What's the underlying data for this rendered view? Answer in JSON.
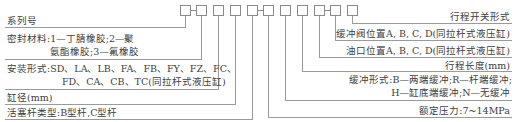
{
  "code_boxes": {
    "count": 11,
    "separators_after": [
      1,
      5,
      9
    ]
  },
  "left_labels": {
    "series": "系列号",
    "seal_line1": "密封材料:1—丁腈橡胶;2—聚",
    "seal_line2": "氨酯橡胶;3—氟橡胶",
    "mount_line1": "安装形式:SD、LA、LB、FA、FB、FY、FZ、FC、",
    "mount_line2": "FD、CA、CB、TC(同拉杆式液压缸)",
    "bore": "缸径(mm)",
    "rod": "活塞杆类型:B型杆,C型杆"
  },
  "right_labels": {
    "switch": "行程开关形式",
    "cushion_valve": "缓冲阀位置A, B, C, D(同拉杆式液压缸)",
    "port": "油口位置A, B, C, D(同拉杆式液压缸)",
    "stroke": "行程长度(mm)",
    "cushion_line1": "缓冲形式:B—两端缓冲;R—杆端缓冲;",
    "cushion_line2": "H—缸底端缓冲;N—无缓冲",
    "pressure": "额定压力:7~14MPa"
  }
}
